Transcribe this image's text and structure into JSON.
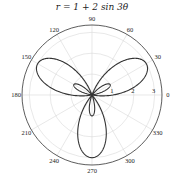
{
  "chart_data": {
    "type": "line",
    "projection": "polar",
    "title": "r = 1 + 2 sin 3θ",
    "equation": {
      "a": 1,
      "b": 2,
      "k": 3,
      "func": "sin"
    },
    "theta_range_deg": [
      0,
      360
    ],
    "angle_ticks": [
      0,
      30,
      60,
      90,
      120,
      150,
      180,
      210,
      240,
      270,
      300,
      330
    ],
    "angle_tick_labels": [
      "0",
      "30",
      "60",
      "90",
      "120",
      "150",
      "180",
      "210",
      "240",
      "270",
      "300",
      "330"
    ],
    "radial_ticks": [
      1,
      2,
      3
    ],
    "radial_tick_labels": [
      "1",
      "2",
      "3"
    ],
    "rlim": [
      0,
      3.35
    ],
    "radial_label_angle_deg": 0,
    "grid": true,
    "legend": null,
    "xlabel": "",
    "ylabel": "",
    "series": [
      {
        "name": "r = 1 + 2 sin 3θ",
        "color": "#333333"
      }
    ]
  },
  "colors": {
    "curve": "#333333",
    "grid": "#d9d9d9",
    "outer": "#333333",
    "text": "#222222"
  }
}
